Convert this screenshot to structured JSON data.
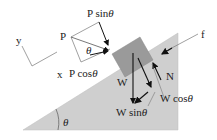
{
  "diagram": {
    "labels": {
      "P": "P",
      "P_sin": "P sin",
      "P_cos": "P cos",
      "theta": "θ",
      "x_axis": "x",
      "y_axis": "y",
      "f": "f",
      "N": "N",
      "W": "W",
      "W_sin": "W sin",
      "W_cos": "W cos"
    },
    "colors": {
      "incline_fill": "#cfcfcf",
      "block_fill": "#9a9a9a",
      "lines": "#777777",
      "arrows": "#111111"
    }
  }
}
